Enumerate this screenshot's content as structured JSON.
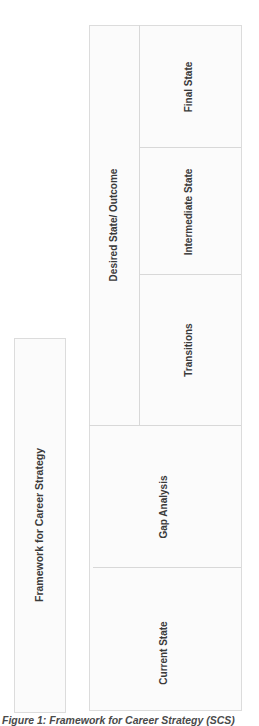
{
  "diagram": {
    "title_box": {
      "label": "Framework for Career Strategy"
    },
    "cells": {
      "desired_state": "Desired State/ Outcome",
      "final_state": "Final State",
      "intermediate_state": "Intermediate State",
      "transitions": "Transitions",
      "gap_analysis": "Gap Analysis",
      "current_state": "Current State"
    },
    "caption": "Figure 1: Framework for Career Strategy (SCS)"
  },
  "colors": {
    "cell_fill": "#fbfbfb",
    "border": "#dcdcdc",
    "text": "#3a3a3a"
  }
}
